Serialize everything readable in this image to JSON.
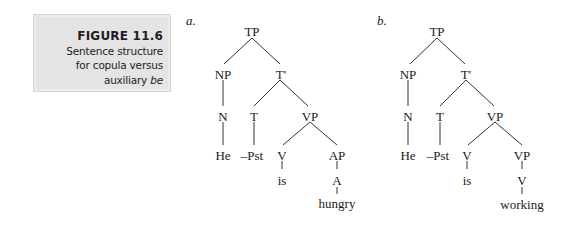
{
  "figure": {
    "number_label": "FIGURE 11.6",
    "caption_lines": [
      "Sentence structure",
      "for copula versus"
    ],
    "caption_last_prefix": "auxiliary ",
    "caption_last_italic": "be",
    "box_color": "#e4e4e4"
  },
  "trees": [
    {
      "label": "a.",
      "nodes": {
        "TP": "TP",
        "NP": "NP",
        "Tbar": "T'",
        "N": "N",
        "T": "T",
        "VP": "VP",
        "He": "He",
        "Pst": "–Pst",
        "V": "V",
        "AP": "AP",
        "is": "is",
        "A": "A",
        "word": "hungry"
      }
    },
    {
      "label": "b.",
      "nodes": {
        "TP": "TP",
        "NP": "NP",
        "Tbar": "T'",
        "N": "N",
        "T": "T",
        "VP": "VP",
        "He": "He",
        "Pst": "–Pst",
        "V": "V",
        "VP2": "VP",
        "is": "is",
        "V2": "V",
        "word": "working"
      }
    }
  ]
}
